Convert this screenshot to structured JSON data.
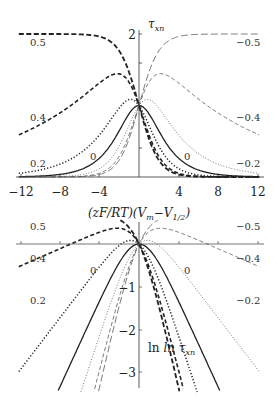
{
  "chart_data": [
    {
      "type": "line",
      "title": "",
      "ylabel": "τ_xn",
      "xlabel": "(zF/RT)(V_m − V_1/2)",
      "xlim": [
        -12,
        12
      ],
      "ylim": [
        0,
        2
      ],
      "x_ticks": [
        "−12",
        "−8",
        "−4",
        "4",
        "8",
        "12"
      ],
      "y_ticks": [
        "2"
      ],
      "grid": false,
      "series": [
        {
          "name": "0.5",
          "style": "thick-dashed",
          "delta": 0.5
        },
        {
          "name": "0.4",
          "style": "thick-dashed-short",
          "delta": 0.4
        },
        {
          "name": "0.2",
          "style": "thick-dotted",
          "delta": 0.2
        },
        {
          "name": "0",
          "style": "solid",
          "delta": 0
        },
        {
          "name": "-0.2",
          "style": "thin-dotted",
          "delta": -0.2
        },
        {
          "name": "-0.4",
          "style": "thin-dashed",
          "delta": -0.4
        },
        {
          "name": "-0.5",
          "style": "thin-long-dashed",
          "delta": -0.5
        }
      ],
      "curve_labels": {
        "left": [
          "0.5",
          "0.4",
          "0.2",
          "0"
        ],
        "right": [
          "−0.5",
          "−0.4",
          "−0.2",
          "0"
        ]
      }
    },
    {
      "type": "line",
      "title": "",
      "ylabel": "ln τ_xn",
      "xlim": [
        -12,
        12
      ],
      "ylim": [
        -3.4,
        0.9
      ],
      "y_ticks": [
        "−1",
        "−2",
        "−3"
      ],
      "grid": false,
      "series": [
        {
          "name": "0.5",
          "delta": 0.5
        },
        {
          "name": "0.4",
          "delta": 0.4
        },
        {
          "name": "0.2",
          "delta": 0.2
        },
        {
          "name": "0",
          "delta": 0
        },
        {
          "name": "-0.2",
          "delta": -0.2
        },
        {
          "name": "-0.4",
          "delta": -0.4
        },
        {
          "name": "-0.5",
          "delta": -0.5
        }
      ],
      "curve_labels": {
        "left": [
          "0.5",
          "0.4",
          "0.2",
          "0"
        ],
        "right": [
          "−0.5",
          "−0.4",
          "−0.2",
          "0"
        ]
      }
    }
  ],
  "labels": {
    "top_ylabel_main": "τ",
    "top_ylabel_sub": "xn",
    "xlabel": "(zF/RT)(V",
    "xlabel_sub1": "m",
    "xlabel_mid": "−V",
    "xlabel_sub2": "1/2",
    "xlabel_end": ")",
    "bottom_ylabel_main": "ln τ",
    "bottom_ylabel_sub": "xn",
    "xt_m12": "−12",
    "xt_m8": "−8",
    "xt_m4": "−4",
    "xt_4": "4",
    "xt_8": "8",
    "xt_12": "12",
    "yt_2": "2",
    "yt_m1": "−1",
    "yt_m2": "−2",
    "yt_m3": "−3",
    "top_l05": "0.5",
    "top_l04": "0.4",
    "top_l02": "0.2",
    "top_l0": "0",
    "top_r05": "−0.5",
    "top_r04": "−0.4",
    "top_r02": "−0.2",
    "top_r0": "0",
    "bot_l05": "0.5",
    "bot_l04": "0.4",
    "bot_l02": "0.2",
    "bot_l0": "0",
    "bot_r05": "−0.5",
    "bot_r04": "−0.4",
    "bot_r02": "−0.2",
    "bot_r0": "0"
  }
}
